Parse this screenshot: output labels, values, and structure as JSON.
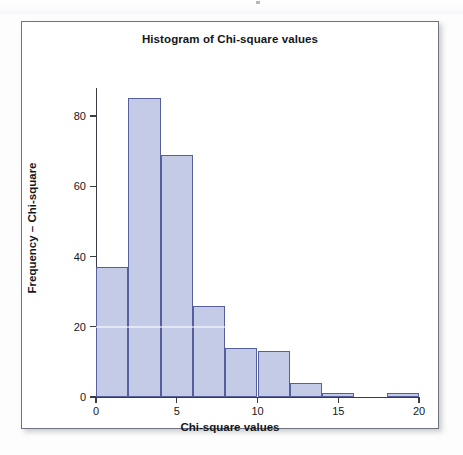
{
  "figure": {
    "title": "Histogram of Chi-square values",
    "xlabel": "Chi-square values",
    "ylabel": "Frequency – Chi-square"
  },
  "colors": {
    "bar_fill": "#c4cbe7",
    "bar_border": "#545f9c",
    "axis": "#3a3c44",
    "frame_border": "#6f7380",
    "text": "#15161a",
    "page_background": "#ffffff"
  },
  "chart_data": {
    "type": "bar",
    "title": "Histogram of Chi-square values",
    "subtitle": "",
    "xlabel": "Chi-square values",
    "ylabel": "Frequency – Chi-square",
    "histogram": true,
    "bin_width": 2,
    "bin_edges": [
      0,
      2,
      4,
      6,
      8,
      10,
      12,
      14,
      16,
      18,
      20
    ],
    "categories": [
      "0-2",
      "2-4",
      "4-6",
      "6-8",
      "8-10",
      "10-12",
      "12-14",
      "14-16",
      "16-18",
      "18-20"
    ],
    "values": [
      37,
      85,
      69,
      26,
      14,
      13,
      4,
      1,
      0,
      1
    ],
    "xlim": [
      0,
      20
    ],
    "ylim": [
      0,
      85
    ],
    "y_axis_range": [
      0,
      80
    ],
    "xticks": [
      0,
      5,
      10,
      15,
      20
    ],
    "xtick_labels": [
      "0",
      "5",
      "10",
      "15",
      "20"
    ],
    "yticks": [
      0,
      20,
      40,
      60,
      80
    ],
    "ytick_labels": [
      "0",
      "20",
      "40",
      "60",
      "80"
    ],
    "grid": false,
    "legend": null,
    "legend_position": "none",
    "annotations": []
  },
  "axes": {
    "y_ticks": [
      {
        "label": "80",
        "value": 80
      },
      {
        "label": "60",
        "value": 60
      },
      {
        "label": "40",
        "value": 40
      },
      {
        "label": "20",
        "value": 20
      },
      {
        "label": "0",
        "value": 0
      }
    ],
    "x_ticks": [
      {
        "label": "0",
        "value": 0
      },
      {
        "label": "5",
        "value": 5
      },
      {
        "label": "10",
        "value": 10
      },
      {
        "label": "15",
        "value": 15
      },
      {
        "label": "20",
        "value": 20
      }
    ]
  }
}
